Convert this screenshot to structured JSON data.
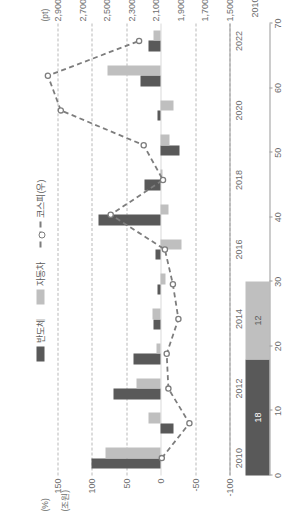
{
  "legend": {
    "semiconductor": "반도체",
    "automobile": "자동차",
    "kospi": "코스피(우)"
  },
  "axes": {
    "left_unit": "(%)",
    "right_unit": "(pt)",
    "inset_unit": "(조원)",
    "left_ticks": [
      "150",
      "100",
      "50",
      "0",
      "-50",
      "-100"
    ],
    "right_ticks": [
      "2,900",
      "2,700",
      "2,500",
      "2,300",
      "2,100",
      "1,900",
      "1,700",
      "1,500"
    ],
    "x_ticks": [
      "2010",
      "2012",
      "2014",
      "2016",
      "2018",
      "2020",
      "2022"
    ],
    "inset_ticks": [
      "70",
      "60",
      "50",
      "40",
      "30",
      "20",
      "10",
      "0"
    ],
    "inset_year": "2010"
  },
  "inset": {
    "semiconductor_value": "18",
    "automobile_value": "12"
  },
  "colors": {
    "semiconductor": "#595959",
    "automobile": "#bfbfbf",
    "kospi_line": "#7d7d7d",
    "grid": "#b9b9b9",
    "axis": "#9a9a9a",
    "text": "#6d6d6d"
  },
  "chart_data": {
    "type": "bar",
    "title": "",
    "xlabel": "",
    "ylabel": "(%)",
    "ylim": [
      -100,
      150
    ],
    "y2lim": [
      1500,
      2900
    ],
    "y2label": "(pt)",
    "grid": true,
    "legend_position": "top",
    "categories": [
      "2010",
      "2011",
      "2012",
      "2013",
      "2014",
      "2015",
      "2016",
      "2017",
      "2018",
      "2019",
      "2020",
      "2021",
      "2022"
    ],
    "series": [
      {
        "name": "반도체",
        "type": "bar",
        "color": "#595959",
        "values": [
          101,
          -19,
          69,
          40,
          10,
          4,
          7,
          90,
          23,
          -28,
          5,
          30,
          18
        ]
      },
      {
        "name": "자동차",
        "type": "bar",
        "color": "#bfbfbf",
        "values": [
          80,
          18,
          35,
          6,
          12,
          -7,
          -30,
          -12,
          -3,
          -13,
          -18,
          77,
          11
        ]
      },
      {
        "name": "코스피(우)",
        "type": "line",
        "color": "#7d7d7d",
        "axis": "right",
        "values": [
          2051,
          1826,
          1997,
          2011,
          1916,
          1961,
          2026,
          2467,
          2041,
          2198,
          2873,
          2978,
          2236
        ]
      }
    ],
    "inset_chart": {
      "type": "bar",
      "stacked": true,
      "unit": "(조원)",
      "xlim": [
        0,
        70
      ],
      "xticks": [
        0,
        10,
        20,
        30,
        40,
        50,
        60,
        70
      ],
      "category": "2010",
      "segments": [
        {
          "name": "반도체",
          "value": 18,
          "color": "#595959"
        },
        {
          "name": "자동차",
          "value": 12,
          "color": "#bfbfbf"
        }
      ]
    }
  }
}
